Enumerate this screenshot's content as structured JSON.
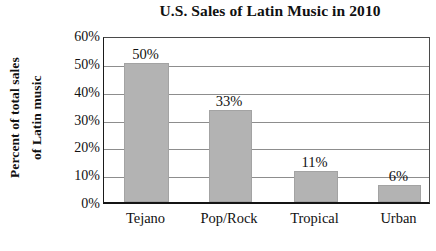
{
  "chart_data": {
    "type": "bar",
    "title": "U.S. Sales of Latin Music in 2010",
    "xlabel": "",
    "ylabel": "Percent of total sales of Latin music",
    "ylabel_lines": [
      "Percent of total sales",
      "of Latin music"
    ],
    "categories": [
      "Tejano",
      "Pop/Rock",
      "Tropical",
      "Urban"
    ],
    "values": [
      50,
      33,
      11,
      6
    ],
    "value_labels": [
      "50%",
      "33%",
      "11%",
      "6%"
    ],
    "ylim": [
      0,
      60
    ],
    "ytick_values": [
      60,
      50,
      40,
      30,
      20,
      10,
      0
    ],
    "ytick_labels": [
      "60%",
      "50%",
      "40%",
      "30%",
      "20%",
      "10%",
      "0%"
    ],
    "grid": true,
    "legend": "none",
    "bar_color": "#b3b3b3",
    "axis_color": "#141414",
    "grid_color": "#8d8d8d",
    "text_color": "#111111"
  }
}
